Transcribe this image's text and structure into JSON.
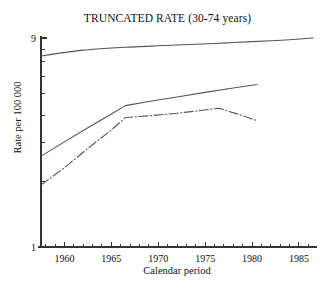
{
  "chart_data": {
    "type": "line",
    "title": "TRUNCATED RATE (30-74 years)",
    "xlabel": "Calendar period",
    "ylabel": "Rate per 100 000",
    "xlim": [
      1957.5,
      1986.5
    ],
    "ylim": [
      1,
      9
    ],
    "yscale": "log",
    "grid": false,
    "legend": "none",
    "xticks": [
      1960,
      1965,
      1970,
      1975,
      1980,
      1985
    ],
    "xtick_labels": [
      "1960",
      "1965",
      "1970",
      "1975",
      "1980",
      "1985"
    ],
    "xminor_tick_step": 1,
    "yticks": [
      1,
      9
    ],
    "ytick_labels": [
      "1",
      "9"
    ],
    "yminor_ticks": [
      2,
      3,
      4,
      5,
      6,
      7,
      8
    ],
    "series": [
      {
        "name": "upper-curve",
        "style": "solid",
        "color": "#555555",
        "x": [
          1957.5,
          1959,
          1960.5,
          1962,
          1963.5,
          1965,
          1966.5,
          1968,
          1970,
          1972,
          1974,
          1976,
          1978,
          1980,
          1982,
          1984,
          1986.5
        ],
        "y": [
          7.45,
          7.62,
          7.78,
          7.92,
          8.02,
          8.1,
          8.16,
          8.22,
          8.29,
          8.36,
          8.43,
          8.5,
          8.58,
          8.66,
          8.74,
          8.84,
          9.0
        ]
      },
      {
        "name": "middle-curve",
        "style": "solid",
        "color": "#555555",
        "x": [
          1957.5,
          1960,
          1962.5,
          1965,
          1966.5,
          1969,
          1972,
          1975,
          1978,
          1980.5
        ],
        "y": [
          2.6,
          3.02,
          3.5,
          4.05,
          4.42,
          4.62,
          4.84,
          5.08,
          5.32,
          5.52
        ]
      },
      {
        "name": "lower-curve",
        "style": "dash-dot",
        "color": "#555555",
        "x": [
          1957.5,
          1960,
          1962.5,
          1965,
          1966.5,
          1969,
          1972,
          1974.5,
          1976.5,
          1978.5,
          1980.5
        ],
        "y": [
          1.92,
          2.3,
          2.82,
          3.42,
          3.9,
          3.97,
          4.08,
          4.2,
          4.3,
          4.04,
          3.78
        ]
      }
    ]
  }
}
